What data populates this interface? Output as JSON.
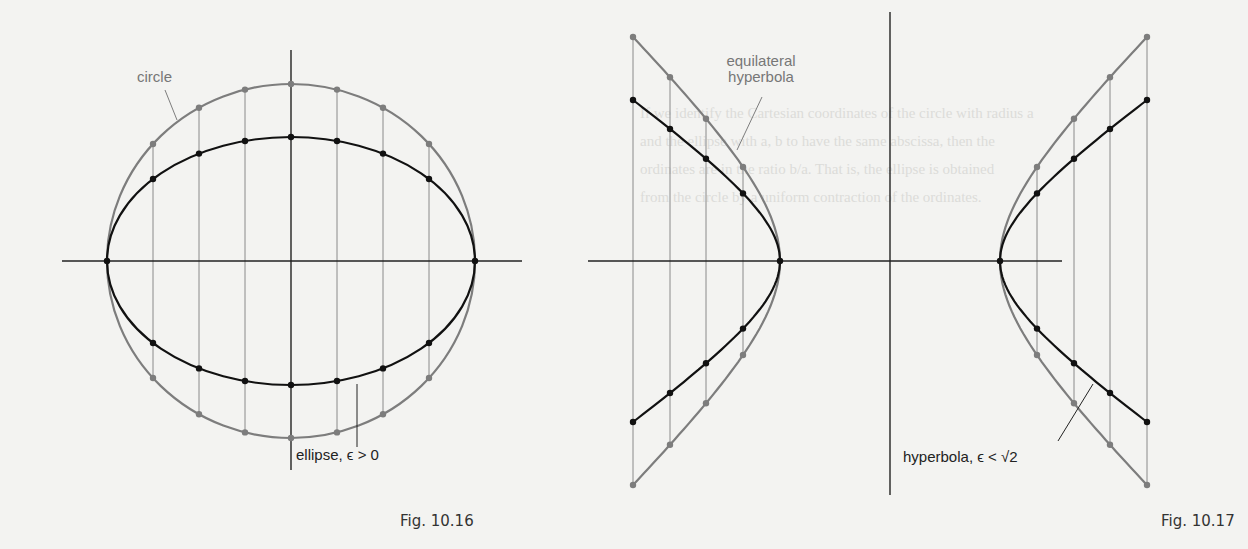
{
  "figures": [
    {
      "id": "fig-10-16",
      "caption": "Fig. 10.16",
      "labels": {
        "circle": "circle",
        "ellipse": "ellipse, ϵ > 0"
      },
      "geometry": {
        "center": [
          291,
          261
        ],
        "x_axis": [
          62,
          522
        ],
        "y_axis": [
          50,
          470
        ],
        "circle_radius": [
          184,
          177
        ],
        "ellipse_radius": [
          184,
          124
        ],
        "ordinate_x": [
          153,
          199,
          245,
          291,
          337,
          383,
          429
        ]
      }
    },
    {
      "id": "fig-10-17",
      "caption": "Fig. 10.17",
      "labels": {
        "equilateral": "equilateral",
        "hyperbola_word": "hyperbola",
        "hyperbola_eps": "hyperbola, ϵ < √2"
      },
      "geometry": {
        "center": [
          890,
          261
        ],
        "x_axis": [
          588,
          1062
        ],
        "y_axis": [
          12,
          495
        ],
        "vertex_left": 780,
        "vertex_right": 1000,
        "ordinate_x_left": [
          633,
          670,
          706,
          743
        ],
        "ordinate_x_right": [
          1037,
          1074,
          1110,
          1147
        ],
        "gray_y_top": 37,
        "gray_y_bottom": 480,
        "black_y_top": 100,
        "black_y_bottom": 417
      }
    }
  ],
  "colors": {
    "background": "#f3f3f1",
    "axis": "#222222",
    "gray_curve": "#7d7d7d",
    "black_curve": "#111111",
    "ordinate": "#8a8a8a"
  },
  "show_through_text": [
    "If we identify the Cartesian coordinates of the circle with radius a",
    "and the ellipse with a, b to have the same abscissa, then the",
    "ordinates are in the ratio b/a. That is, the ellipse is obtained",
    "from the circle by a uniform contraction of the ordinates."
  ]
}
